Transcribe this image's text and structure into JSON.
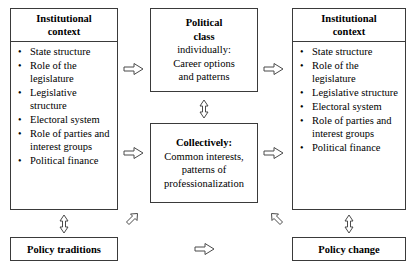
{
  "diagram": {
    "boxes": {
      "left_context": {
        "header": "Institutional\ncontext",
        "header_line1": "Institutional",
        "header_line2": "context",
        "items": [
          "State structure",
          "Role of the legislature",
          "Legislative structure",
          "Electoral system",
          "Role of parties and interest groups",
          "Political finance"
        ]
      },
      "right_context": {
        "header_line1": "Institutional",
        "header_line2": "context",
        "items": [
          "State structure",
          "Role of the legislature",
          "Legislative structure",
          "Electoral system",
          "Role of parties and interest groups",
          "Political finance"
        ]
      },
      "political_class_individual": {
        "line1": "Political",
        "line2": "class",
        "line3": "individually:",
        "line4": "Career options",
        "line5": "and patterns"
      },
      "political_class_collective": {
        "line1": "Collectively:",
        "line2": "Common interests,",
        "line3": "patterns of",
        "line4": "professionalization"
      },
      "policy_traditions": {
        "label": "Policy traditions"
      },
      "policy_change": {
        "label": "Policy change"
      }
    },
    "arrows": [
      {
        "name": "left-to-individual",
        "glyph": "right-arrow-icon"
      },
      {
        "name": "left-to-collective",
        "glyph": "right-arrow-icon"
      },
      {
        "name": "individual-to-right",
        "glyph": "right-arrow-icon"
      },
      {
        "name": "collective-to-right",
        "glyph": "right-arrow-icon"
      },
      {
        "name": "individual-collective-link",
        "glyph": "up-down-arrow-icon"
      },
      {
        "name": "left-context-to-traditions",
        "glyph": "up-down-arrow-icon"
      },
      {
        "name": "right-context-to-change",
        "glyph": "up-down-arrow-icon"
      },
      {
        "name": "traditions-to-collective",
        "glyph": "diagonal-up-right-arrow-icon"
      },
      {
        "name": "collective-to-change",
        "glyph": "diagonal-up-left-arrow-icon"
      },
      {
        "name": "traditions-to-change",
        "glyph": "right-arrow-icon"
      }
    ],
    "bullet_glyph": "•"
  }
}
